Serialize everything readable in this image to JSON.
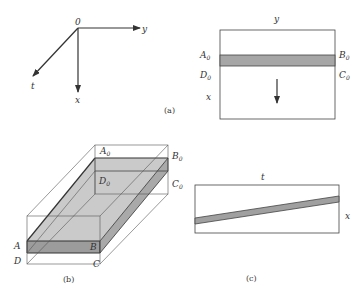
{
  "figure_a_axes": {
    "origin": "0",
    "axis_y": "y",
    "axis_x": "x",
    "axis_t": "t"
  },
  "figure_a_section": {
    "top_label": "y",
    "left_top": "A",
    "left_top_sub": "0",
    "right_top": "B",
    "right_top_sub": "0",
    "left_bottom": "D",
    "left_bottom_sub": "0",
    "right_bottom": "C",
    "right_bottom_sub": "0",
    "side_label": "x"
  },
  "caption_a": "(a)",
  "figure_b": {
    "A": "A",
    "B": "B",
    "C": "C",
    "D": "D",
    "A0": "A",
    "A0_sub": "0",
    "B0": "B",
    "B0_sub": "0",
    "C0": "C",
    "C0_sub": "0",
    "D0": "D",
    "D0_sub": "0"
  },
  "caption_b": "(b)",
  "figure_c": {
    "top_label": "t",
    "side_label": "x"
  },
  "caption_c": "(c)",
  "colors": {
    "line": "#3a3a3a",
    "slab_top": "#c8c8c8",
    "slab_front": "#9a9a9a",
    "slab_side": "#a8a8a8",
    "strip": "#a0a0a0"
  }
}
